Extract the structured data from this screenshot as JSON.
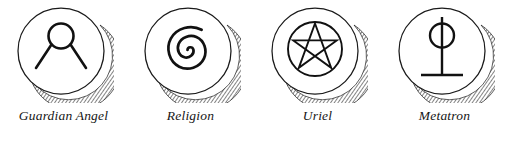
{
  "plate": {
    "background_color": "#ffffff",
    "ink_color": "#1a1a1a",
    "symbol_count": 4
  },
  "symbols": [
    {
      "label": "Guardian Angel",
      "icon_name": "guardian-angel-glyph",
      "glyph_description": "small circle with two diagonal rays descending left and right",
      "medallion": "engraved-disc-with-hatched-shadow"
    },
    {
      "label": "Religion",
      "icon_name": "spiral-glyph",
      "glyph_description": "counterclockwise spiral of about two and a half turns",
      "medallion": "engraved-disc-with-hatched-shadow"
    },
    {
      "label": "Uriel",
      "icon_name": "pentagram-glyph",
      "glyph_description": "point-up five pointed star inscribed in a circle",
      "medallion": "engraved-disc-with-hatched-shadow"
    },
    {
      "label": "Metatron",
      "icon_name": "metatron-glyph",
      "glyph_description": "vertical staff through a circle with horizontal base bar",
      "medallion": "engraved-disc-with-hatched-shadow"
    }
  ]
}
